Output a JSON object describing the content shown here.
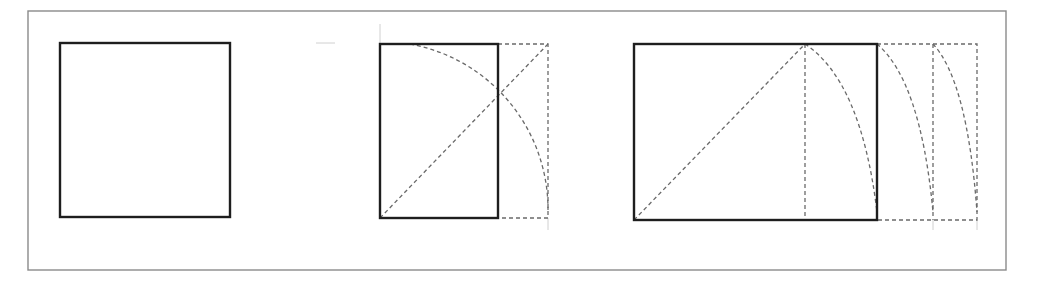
{
  "diagram": {
    "colors": {
      "background": "#ffffff",
      "frame": "#8a8a8a",
      "solid_line": "#1e1e1e",
      "construction_line": "#6a6a6a"
    },
    "frame": {
      "x": 28,
      "y": 11,
      "width": 978,
      "height": 259
    },
    "figures": [
      {
        "name": "square",
        "solid_rect": {
          "x": 60,
          "y": 43,
          "width": 170,
          "height": 174
        }
      },
      {
        "name": "root-rectangle",
        "solid_rect": {
          "x": 380,
          "y": 44,
          "width": 118,
          "height": 174
        },
        "dashed_extension": {
          "x": 498,
          "y": 44,
          "width": 50,
          "height": 174
        },
        "diagonal": {
          "x1": 380,
          "y1": 218,
          "x2": 548,
          "y2": 44
        },
        "arc": {
          "from": [
            410,
            44
          ],
          "to": [
            548,
            210
          ],
          "radius": 168
        }
      },
      {
        "name": "extended-rectangle",
        "solid_rect": {
          "x": 634,
          "y": 44,
          "width": 243,
          "height": 176
        },
        "inner_dashed_vertical_x": 805,
        "diagonal": {
          "x1": 634,
          "y1": 220,
          "x2": 805,
          "y2": 44
        },
        "extension_verticals_x": [
          933,
          977
        ],
        "arcs": [
          {
            "from": [
              805,
              44
            ],
            "to": [
              877,
              212
            ]
          },
          {
            "from": [
              877,
              44
            ],
            "to": [
              933,
              212
            ]
          },
          {
            "from": [
              933,
              44
            ],
            "to": [
              977,
              212
            ]
          }
        ]
      }
    ]
  }
}
